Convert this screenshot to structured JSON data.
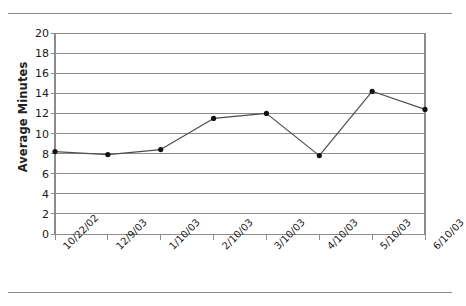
{
  "chart_data": {
    "type": "line",
    "title": "",
    "subtitle": "",
    "xlabel": "",
    "ylabel": "Average Minutes",
    "categories": [
      "10/22/02",
      "12/9/03",
      "1/10/03",
      "2/10/03",
      "3/10/03",
      "4/10/03",
      "5/10/03",
      "6/10/03"
    ],
    "values": [
      8.2,
      7.9,
      8.4,
      11.5,
      12.0,
      7.8,
      14.2,
      12.4
    ],
    "series": [
      {
        "name": "Average Minutes",
        "values": [
          8.2,
          7.9,
          8.4,
          11.5,
          12.0,
          7.8,
          14.2,
          12.4
        ]
      }
    ],
    "ylim": [
      0,
      20
    ],
    "ytick_step": 2,
    "ytick_labels": [
      "0",
      "2",
      "4",
      "6",
      "8",
      "10",
      "12",
      "14",
      "16",
      "18",
      "20"
    ],
    "grid": true,
    "grid_axis": "y",
    "legend": false,
    "legend_position": "none",
    "marker": "circle",
    "line_color": "#4d4d4d",
    "marker_color": "#111111",
    "grid_color": "#8c8c8c",
    "axis_color": "#8c8c8c",
    "background_color": "#ffffff",
    "text_color": "#1a1a1a"
  },
  "page": {
    "top_rule": "",
    "bottom_rule": ""
  }
}
